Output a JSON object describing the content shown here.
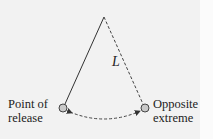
{
  "diagram": {
    "labels": {
      "left": [
        "Point of",
        "release"
      ],
      "right": [
        "Opposite",
        "extreme"
      ],
      "length": "L"
    },
    "colors": {
      "line": "#333333",
      "bob_fill": "#c9c9c9",
      "background": "#f2f2f2"
    },
    "elements": {
      "pivot": [
        104,
        17
      ],
      "left_bob": [
        63,
        108
      ],
      "right_bob": [
        145,
        108
      ]
    }
  }
}
